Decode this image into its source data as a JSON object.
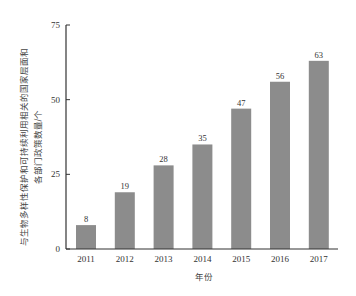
{
  "chart_data": {
    "type": "bar",
    "title": "",
    "xlabel": "年份",
    "ylabel_line1": "与生物多样性保护和可持续利用相关的国家层面和",
    "ylabel_line2": "各部门政策数量/个",
    "ylabel": "与生物多样性保护和可持续利用相关的国家层面和各部门政策数量/个",
    "categories": [
      "2011",
      "2012",
      "2013",
      "2014",
      "2015",
      "2016",
      "2017"
    ],
    "values": [
      8,
      19,
      28,
      35,
      47,
      56,
      63
    ],
    "ylim": [
      0,
      75
    ],
    "yticks": [
      0,
      25,
      50,
      75
    ],
    "grid": false,
    "legend": null,
    "bar_color": "#8c8c8c",
    "data_labels": true
  }
}
